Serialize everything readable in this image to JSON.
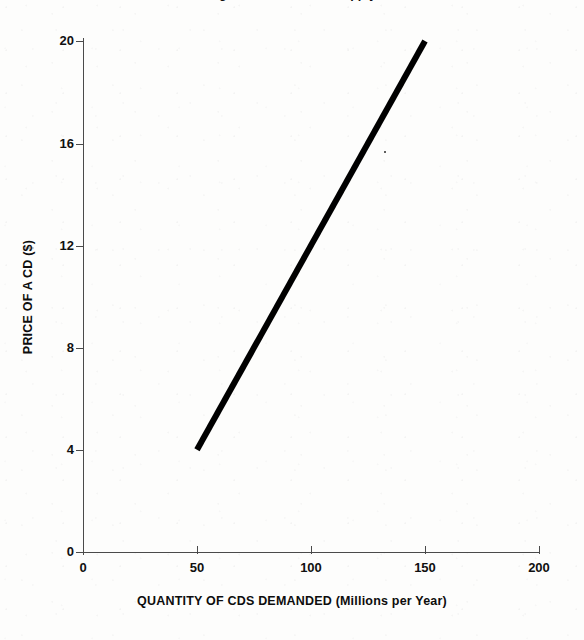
{
  "figure": {
    "title_clipped": "Figure: Demand and Supply",
    "background_color": "#fdfdfc",
    "ink_color": "#000000",
    "axis_color": "#4a4a4a"
  },
  "chart_data": {
    "type": "line",
    "title": "Figure: Demand and Supply",
    "xlabel": "QUANTITY OF CDS DEMANDED (Millions per Year)",
    "ylabel": "PRICE OF A CD ($)",
    "xlim": [
      0,
      200
    ],
    "ylim": [
      0,
      20
    ],
    "xticks": [
      0,
      50,
      100,
      150,
      200
    ],
    "xtick_labels": [
      "0",
      "50",
      "100",
      "150",
      "200"
    ],
    "yticks": [
      0,
      4,
      8,
      12,
      16,
      20
    ],
    "ytick_labels": [
      "0",
      "4",
      "8",
      "12",
      "16",
      "20"
    ],
    "grid": false,
    "legend": null,
    "series": [
      {
        "name": "Supply",
        "color": "#000000",
        "linewidth": 6,
        "x": [
          50,
          150
        ],
        "y": [
          4,
          20
        ],
        "points": [
          {
            "quantity": 50,
            "price": 4
          },
          {
            "quantity": 150,
            "price": 20
          }
        ],
        "slope_per_unit": 0.16,
        "intercept": -4
      }
    ]
  },
  "axes": {
    "y": {
      "title": "PRICE OF A CD ($)",
      "ticks": [
        {
          "value": 20,
          "label": "20"
        },
        {
          "value": 16,
          "label": "16"
        },
        {
          "value": 12,
          "label": "12"
        },
        {
          "value": 8,
          "label": "8"
        },
        {
          "value": 4,
          "label": "4"
        },
        {
          "value": 0,
          "label": "0"
        }
      ]
    },
    "x": {
      "title": "QUANTITY OF CDS DEMANDED (Millions per Year)",
      "ticks": [
        {
          "value": 0,
          "label": "0"
        },
        {
          "value": 50,
          "label": "50"
        },
        {
          "value": 100,
          "label": "100"
        },
        {
          "value": 150,
          "label": "150"
        },
        {
          "value": 200,
          "label": "200"
        }
      ]
    }
  }
}
